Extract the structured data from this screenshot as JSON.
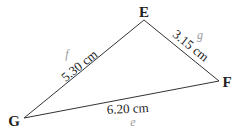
{
  "diagram": {
    "type": "triangle",
    "vertices": [
      {
        "id": "E",
        "label": "E",
        "x": 144,
        "y": 20,
        "lx": 144,
        "ly": 17
      },
      {
        "id": "F",
        "label": "F",
        "x": 219,
        "y": 81,
        "lx": 227,
        "ly": 87
      },
      {
        "id": "G",
        "label": "G",
        "x": 24,
        "y": 118,
        "lx": 14,
        "ly": 126
      }
    ],
    "sides": [
      {
        "id": "f",
        "from": "G",
        "to": "E",
        "name": "f",
        "length": "5.30 cm"
      },
      {
        "id": "g",
        "from": "E",
        "to": "F",
        "name": "g",
        "length": "3.15 cm"
      },
      {
        "id": "e",
        "from": "G",
        "to": "F",
        "name": "e",
        "length": "6.20 cm"
      }
    ],
    "colors": {
      "line": "#333333",
      "text": "#222222",
      "side_name": "#9a9a9a"
    }
  }
}
